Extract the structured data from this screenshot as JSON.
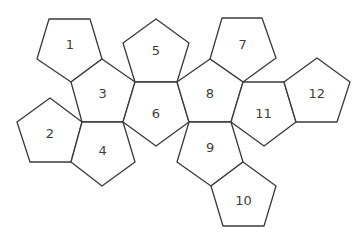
{
  "diagram": {
    "face_count": 12,
    "faces": [
      {
        "id": "1",
        "label": "1"
      },
      {
        "id": "2",
        "label": "2"
      },
      {
        "id": "3",
        "label": "3"
      },
      {
        "id": "4",
        "label": "4"
      },
      {
        "id": "5",
        "label": "5"
      },
      {
        "id": "6",
        "label": "6"
      },
      {
        "id": "7",
        "label": "7"
      },
      {
        "id": "8",
        "label": "8"
      },
      {
        "id": "9",
        "label": "9"
      },
      {
        "id": "10",
        "label": "10"
      },
      {
        "id": "11",
        "label": "11"
      },
      {
        "id": "12",
        "label": "12"
      }
    ],
    "colors": {
      "stroke": "#3a3a3a",
      "fill": "#ffffff",
      "label": "#3f3f3f"
    }
  }
}
